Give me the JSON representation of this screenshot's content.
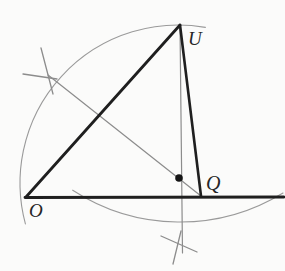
{
  "figure": {
    "description_name": "geometric-compass-construction",
    "colors": {
      "background": "#fbfbfa",
      "thick_line": "#1f1f1f",
      "thin_line": "#8c8c8c",
      "arc_line": "#9a9a9a",
      "tick_line": "#8c8c8c",
      "dot_fill": "#151515",
      "label_color": "#262626"
    },
    "points": {
      "O": {
        "x": 26,
        "y": 197
      },
      "U": {
        "x": 180,
        "y": 25
      },
      "Q": {
        "x": 201,
        "y": 196
      }
    },
    "labels": {
      "O": {
        "text": "O",
        "x": 29,
        "y": 217
      },
      "U": {
        "text": "U",
        "x": 188,
        "y": 45
      },
      "Q": {
        "text": "Q",
        "x": 206,
        "y": 190
      }
    },
    "thick_lines": [
      {
        "name": "base-line",
        "x1": 25,
        "y1": 197.5,
        "x2": 284,
        "y2": 197,
        "width": 2.8
      },
      {
        "name": "segment-O-U",
        "x1": 26,
        "y1": 197,
        "x2": 180,
        "y2": 25,
        "width": 2.8
      },
      {
        "name": "segment-U-Q",
        "x1": 180,
        "y1": 25,
        "x2": 201,
        "y2": 196,
        "width": 2.6
      }
    ],
    "thin_lines": [
      {
        "name": "construction-line-through-U-vertical",
        "x1": 180,
        "y1": 25,
        "x2": 182.5,
        "y2": 253,
        "width": 1.2
      },
      {
        "name": "construction-line-upper-left-to-Q",
        "x1": 48,
        "y1": 75,
        "x2": 201,
        "y2": 196,
        "width": 1.2
      }
    ],
    "arcs": [
      {
        "name": "large-compass-arc",
        "d": "M 205.4 27.4 A 158 158 0 0 0 25.4 223.9",
        "width": 1.1
      },
      {
        "name": "lower-compass-arc",
        "d": "M 72.7 190.2 A 197 197 0 0 0 283 193",
        "width": 1.1
      }
    ],
    "tick_marks": [
      {
        "name": "tick-mark-upper-left-shallow",
        "x1": 23,
        "y1": 74,
        "x2": 57,
        "y2": 79,
        "width": 1.3
      },
      {
        "name": "tick-mark-upper-left-steep",
        "x1": 41,
        "y1": 48,
        "x2": 53,
        "y2": 94,
        "width": 1.3
      },
      {
        "name": "tick-mark-bottom-shallow",
        "x1": 161,
        "y1": 236,
        "x2": 197,
        "y2": 252,
        "width": 1.3
      },
      {
        "name": "tick-mark-bottom-steep",
        "x1": 181,
        "y1": 231,
        "x2": 173,
        "y2": 264,
        "width": 1.3
      }
    ],
    "dot": {
      "name": "intersection-point-dot",
      "cx": 179,
      "cy": 178,
      "r": 3.8
    }
  }
}
